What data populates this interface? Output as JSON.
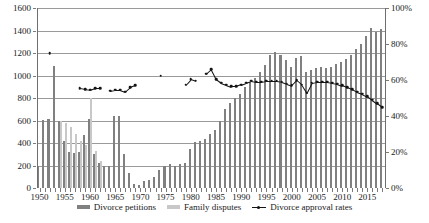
{
  "chart_data": {
    "type": "bar",
    "title": "",
    "xlabel": "",
    "ylabel": "",
    "y_left": {
      "min": 0,
      "max": 1600,
      "ticks": [
        0,
        200,
        400,
        600,
        800,
        1000,
        1200,
        1400,
        1600
      ],
      "tick_labels": [
        "0",
        "200",
        "400",
        "600",
        "800",
        "1000",
        "1200",
        "1400",
        "1600"
      ]
    },
    "y_right": {
      "min": 0,
      "max": 100,
      "ticks": [
        0,
        20,
        40,
        60,
        80,
        100
      ],
      "tick_labels": [
        "0%",
        "20%",
        "40%",
        "60%",
        "80%",
        "100%"
      ]
    },
    "x": [
      1950,
      1951,
      1952,
      1953,
      1954,
      1955,
      1956,
      1957,
      1958,
      1959,
      1960,
      1961,
      1962,
      1963,
      1964,
      1965,
      1966,
      1967,
      1968,
      1969,
      1970,
      1971,
      1972,
      1973,
      1974,
      1975,
      1976,
      1977,
      1978,
      1979,
      1980,
      1981,
      1982,
      1983,
      1984,
      1985,
      1986,
      1987,
      1988,
      1989,
      1990,
      1991,
      1992,
      1993,
      1994,
      1995,
      1996,
      1997,
      1998,
      1999,
      2000,
      2001,
      2002,
      2003,
      2004,
      2005,
      2006,
      2007,
      2008,
      2009,
      2010,
      2011,
      2012,
      2013,
      2014,
      2015,
      2016,
      2017,
      2018
    ],
    "x_tick_labels": [
      "1950",
      "1955",
      "1960",
      "1965",
      "1970",
      "1975",
      "1980",
      "1985",
      "1990",
      "1995",
      "2000",
      "2005",
      "2010",
      "2015"
    ],
    "x_ticks": [
      1950,
      1955,
      1960,
      1965,
      1970,
      1975,
      1980,
      1985,
      1990,
      1995,
      2000,
      2005,
      2010,
      2015
    ],
    "grid": true,
    "legend_position": "bottom",
    "series": [
      {
        "name": "Divorce petitions",
        "type": "bar",
        "axis": "left",
        "color": "#808080",
        "values": [
          200,
          605,
          610,
          1085,
          600,
          420,
          320,
          310,
          320,
          470,
          610,
          300,
          220,
          200,
          200,
          640,
          640,
          300,
          130,
          40,
          30,
          60,
          70,
          100,
          160,
          200,
          210,
          200,
          210,
          220,
          350,
          410,
          420,
          440,
          480,
          520,
          600,
          700,
          760,
          800,
          840,
          900,
          940,
          980,
          1030,
          1090,
          1185,
          1205,
          1185,
          1135,
          1080,
          1160,
          1170,
          1030,
          1050,
          1070,
          1080,
          1070,
          1080,
          1100,
          1120,
          1150,
          1180,
          1240,
          1280,
          1350,
          1420,
          1390,
          1410
        ]
      },
      {
        "name": "Family disputes",
        "type": "bar",
        "axis": "left",
        "color": "#c8c8c8",
        "values": [
          0,
          0,
          0,
          0,
          600,
          580,
          540,
          480,
          420,
          380,
          800,
          330,
          240,
          0,
          0,
          0,
          0,
          0,
          0,
          0,
          0,
          0,
          0,
          0,
          0,
          0,
          0,
          0,
          0,
          0,
          0,
          0,
          0,
          0,
          0,
          0,
          0,
          0,
          0,
          0,
          0,
          0,
          0,
          0,
          0,
          0,
          0,
          0,
          0,
          0,
          0,
          0,
          0,
          0,
          0,
          0,
          0,
          0,
          0,
          0,
          0,
          0,
          0,
          0,
          0,
          0,
          0,
          0,
          0
        ]
      },
      {
        "name": "Divorce approval rates",
        "type": "line",
        "axis": "right",
        "color": "#141414",
        "values": [
          null,
          null,
          75,
          null,
          null,
          null,
          null,
          null,
          55.5,
          55.0,
          54.5,
          55.5,
          55.5,
          null,
          54.0,
          54.5,
          54.5,
          53.5,
          56.0,
          57.0,
          null,
          null,
          null,
          null,
          62.5,
          null,
          null,
          null,
          null,
          57.5,
          60.5,
          59.5,
          null,
          63.5,
          66.0,
          60.5,
          58.5,
          57.5,
          56.5,
          56.5,
          57.5,
          58.5,
          59.5,
          59.0,
          59.0,
          59.5,
          59.5,
          59.5,
          59.0,
          58.0,
          57.0,
          60.0,
          57.5,
          53.0,
          58.5,
          59.0,
          59.0,
          59.0,
          58.5,
          58.0,
          57.0,
          56.0,
          55.0,
          53.5,
          52.5,
          51.0,
          49.0,
          47.0,
          45.0
        ]
      }
    ]
  },
  "legend": {
    "items": [
      {
        "label": "Divorce petitions",
        "marker": "bar-dark"
      },
      {
        "label": "Family disputes",
        "marker": "bar-light"
      },
      {
        "label": "Divorce approval rates",
        "marker": "line-dot"
      }
    ]
  }
}
